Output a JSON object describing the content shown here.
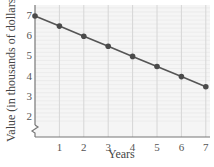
{
  "chart_data": {
    "type": "line",
    "title": "",
    "xlabel": "Years",
    "ylabel": "Value (in thousands of dollars)",
    "x": [
      0,
      1,
      2,
      3,
      4,
      5,
      6,
      7
    ],
    "series": [
      {
        "name": "Value",
        "values": [
          7,
          6.5,
          6,
          5.5,
          5,
          4.5,
          4,
          3.5
        ]
      }
    ],
    "x_ticks": [
      "1",
      "2",
      "3",
      "4",
      "5",
      "6",
      "7"
    ],
    "y_ticks": [
      "2",
      "3",
      "4",
      "5",
      "6",
      "7"
    ],
    "xlim": [
      0,
      7
    ],
    "ylim": [
      1.5,
      7.5
    ],
    "grid": true,
    "axis_break": "y-axis near bottom",
    "legend": null
  },
  "colors": {
    "line": "#555555",
    "marker": "#4a4a4a",
    "axis": "#777777",
    "grid": "#e2e2e2",
    "plot_bg": "#f4f4f4"
  }
}
